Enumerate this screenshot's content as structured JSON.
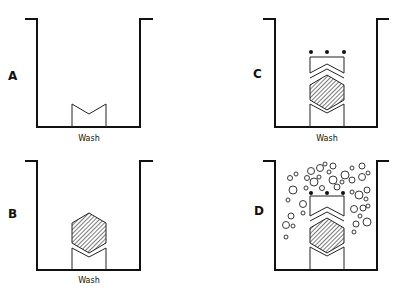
{
  "colors": {
    "ink": "#111111",
    "background": "#ffffff"
  },
  "panels": [
    {
      "id": "A",
      "label": "A",
      "caption": "Wash",
      "state": "empty well with bottom V-block"
    },
    {
      "id": "B",
      "label": "B",
      "caption": "Wash",
      "state": "hexagonal shaded molecule bound on V-block"
    },
    {
      "id": "C",
      "label": "C",
      "caption": "Wash",
      "state": "top block with three dots bound on top of molecule"
    },
    {
      "id": "D",
      "label": "D",
      "caption": "",
      "state": "bubbles / signal produced around complex"
    }
  ]
}
